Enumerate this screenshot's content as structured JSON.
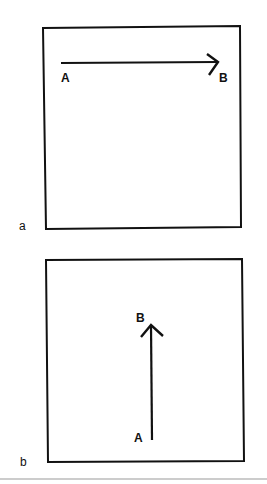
{
  "figure": {
    "panels": [
      {
        "id": "a",
        "label": "a",
        "arrow": {
          "direction": "horizontal-right",
          "start_label": "A",
          "end_label": "B"
        }
      },
      {
        "id": "b",
        "label": "b",
        "arrow": {
          "direction": "vertical-up",
          "start_label": "A",
          "end_label": "B"
        }
      }
    ],
    "colors": {
      "stroke": "#111111",
      "rule": "#999999",
      "background": "#ffffff"
    }
  }
}
